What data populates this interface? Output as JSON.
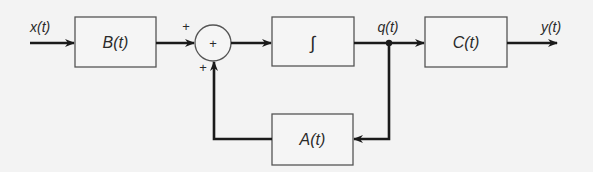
{
  "diagram": {
    "type": "block-diagram",
    "title": "",
    "signals": {
      "input": "x(t)",
      "state": "q(t)",
      "output": "y(t)"
    },
    "blocks": [
      {
        "id": "B",
        "label": "B(t)"
      },
      {
        "id": "integrator",
        "label": "∫"
      },
      {
        "id": "C",
        "label": "C(t)"
      },
      {
        "id": "A",
        "label": "A(t)"
      }
    ],
    "summing_junction": {
      "center_sign": "+",
      "input_signs": [
        "+",
        "+"
      ]
    },
    "connections": [
      {
        "from": "x(t)",
        "to": "B"
      },
      {
        "from": "B",
        "to": "summing_junction",
        "sign": "+"
      },
      {
        "from": "summing_junction",
        "to": "integrator"
      },
      {
        "from": "integrator",
        "to": "q(t)"
      },
      {
        "from": "q(t)",
        "to": "C"
      },
      {
        "from": "C",
        "to": "y(t)"
      },
      {
        "from": "q(t)",
        "to": "A"
      },
      {
        "from": "A",
        "to": "summing_junction",
        "sign": "+"
      }
    ],
    "colors": {
      "background": "#f3f3f3",
      "line": "#1a1a1a",
      "box_border": "#555555"
    }
  }
}
